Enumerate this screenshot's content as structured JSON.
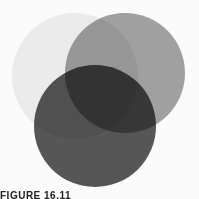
{
  "figure": {
    "caption": "FIGURE 16.11",
    "circles": [
      {
        "name": "light-circle",
        "cx": 75,
        "cy": 76,
        "r": 63,
        "color": "#ececec",
        "opacity": 0.85
      },
      {
        "name": "medium-circle",
        "cx": 125,
        "cy": 73,
        "r": 60,
        "color": "#8c8c8c",
        "opacity": 0.8
      },
      {
        "name": "dark-circle",
        "cx": 95,
        "cy": 126,
        "r": 61,
        "color": "#3a3a3a",
        "opacity": 0.85
      }
    ]
  }
}
